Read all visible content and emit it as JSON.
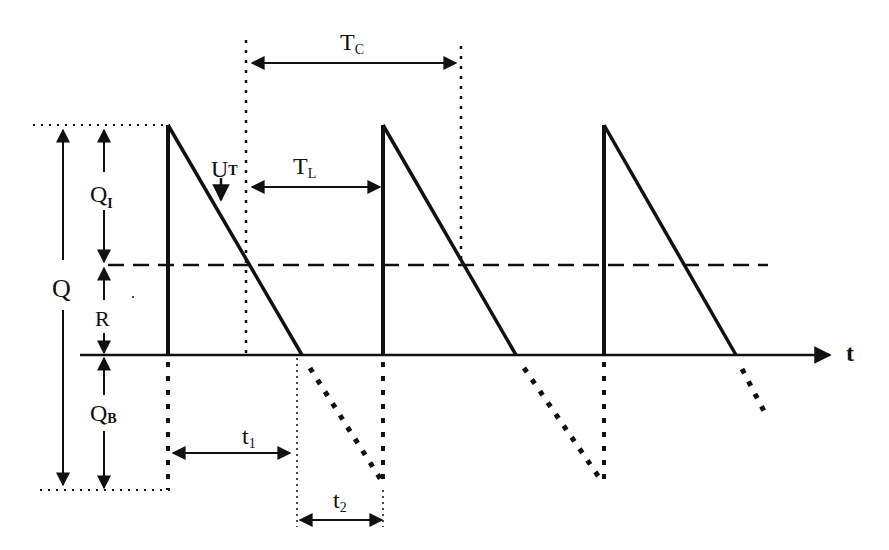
{
  "diagram": {
    "type": "inventory sawtooth model with backorders",
    "axis": {
      "time_label": "t"
    },
    "labels": {
      "Q": "Q",
      "QI_main": "Q",
      "QI_sub": "I",
      "R": "R",
      "QB_main": "Q",
      "QB_sub": "B",
      "UT_main": "U",
      "UT_sub": "T",
      "TL_main": "T",
      "TL_sub": "L",
      "TC_main": "T",
      "TC_sub": "C",
      "t1_main": "t",
      "t1_sub": "1",
      "t2_main": "t",
      "t2_sub": "2"
    },
    "annotations": {
      "Q": "Total order quantity (max inventory + max backorder)",
      "QI": "Maximum inventory level",
      "R": "Reorder point",
      "QB": "Maximum backorder quantity",
      "UT": "Demand / usage rate",
      "TL": "Lead time",
      "TC": "Cycle time",
      "t1": "Time with positive inventory",
      "t2": "Time with backorders"
    },
    "colors": {
      "ink": "#111111",
      "background": "#ffffff"
    }
  }
}
